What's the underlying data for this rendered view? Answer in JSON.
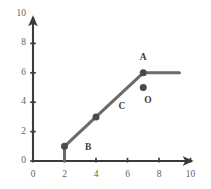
{
  "chart_data": {
    "type": "line",
    "title": "",
    "xlabel": "",
    "ylabel": "",
    "xlim": [
      0,
      10
    ],
    "ylim": [
      0,
      10
    ],
    "xticks": [
      0,
      2,
      4,
      6,
      8,
      10
    ],
    "yticks": [
      0,
      2,
      4,
      6,
      8,
      10
    ],
    "xtick_labels": [
      "0",
      "2",
      "4",
      "6",
      "8",
      "10"
    ],
    "ytick_labels": [
      "0",
      "2",
      "4",
      "6",
      "8",
      "10"
    ],
    "grid": false,
    "legend": null,
    "series": [
      {
        "name": "path",
        "color": "#6a6a6a",
        "points": [
          {
            "x": 2,
            "y": 0
          },
          {
            "x": 2,
            "y": 1
          },
          {
            "x": 4,
            "y": 3
          },
          {
            "x": 7,
            "y": 6
          },
          {
            "x": 9.3,
            "y": 6
          }
        ]
      }
    ],
    "markers": [
      {
        "name": "start-marker",
        "x": 2,
        "y": 1,
        "color": "#4a4a4a"
      },
      {
        "name": "mid-marker",
        "x": 4,
        "y": 3,
        "color": "#4a4a4a"
      },
      {
        "name": "vertex-marker-a",
        "x": 7,
        "y": 6,
        "color": "#4a4a4a"
      },
      {
        "name": "point-marker-o",
        "x": 7,
        "y": 5,
        "color": "#4a4a4a"
      }
    ],
    "annotations": [
      {
        "name": "label-a",
        "text": "A",
        "x": 7.0,
        "y": 7.0
      },
      {
        "name": "label-o",
        "text": "O",
        "x": 7.3,
        "y": 4.1
      },
      {
        "name": "label-c",
        "text": "C",
        "x": 5.65,
        "y": 3.65
      },
      {
        "name": "label-b",
        "text": "B",
        "x": 3.5,
        "y": 0.9
      }
    ]
  },
  "axes": {
    "axis_color": "#3b3b3b",
    "tick_color": "#3b3b3b",
    "label_color": "#5f5f5f"
  }
}
